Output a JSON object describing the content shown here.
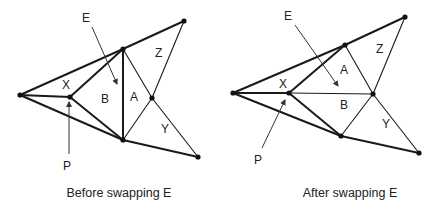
{
  "diagrams": [
    {
      "caption": "Before swapping E",
      "labels": {
        "E": "E",
        "X": "X",
        "B": "B",
        "A": "A",
        "Z": "Z",
        "Y": "Y",
        "P": "P"
      }
    },
    {
      "caption": "After swapping E",
      "labels": {
        "E": "E",
        "X": "X",
        "B": "B",
        "A": "A",
        "Z": "Z",
        "Y": "Y",
        "P": "P"
      }
    }
  ],
  "colors": {
    "stroke": "#1a1a1a",
    "text": "#222222",
    "background": "#ffffff"
  }
}
